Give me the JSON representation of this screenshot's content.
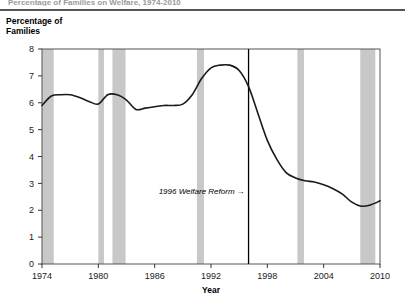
{
  "page": {
    "cut_off_header": "Percentage of Families on Welfare, 1974-2010",
    "y_axis_caption": "Percentage of\nFamilies"
  },
  "chart_data": {
    "type": "line",
    "title": "",
    "subtitle": "",
    "xlabel": "Year",
    "ylabel": "Percentage of Families",
    "xlim": [
      1974,
      2010
    ],
    "ylim": [
      0,
      8
    ],
    "xticks": [
      1974,
      1980,
      1986,
      1992,
      1998,
      2004,
      2010
    ],
    "xticklabels": [
      "1974",
      "1980",
      "1986",
      "1992",
      "1998",
      "2004",
      "2010"
    ],
    "yticks": [
      0,
      1,
      2,
      3,
      4,
      5,
      6,
      7,
      8
    ],
    "yticklabels": [
      "0",
      "1",
      "2",
      "3",
      "4",
      "5",
      "6",
      "7",
      "8"
    ],
    "grid": false,
    "legend": null,
    "line_color": "#1a1a1a",
    "band_color": "#c8c8c8",
    "marker_line_color": "#000000",
    "x": [
      1974,
      1975,
      1976,
      1977,
      1978,
      1979,
      1980,
      1981,
      1982,
      1983,
      1984,
      1985,
      1986,
      1987,
      1988,
      1989,
      1990,
      1991,
      1992,
      1993,
      1994,
      1995,
      1996,
      1997,
      1998,
      1999,
      2000,
      2001,
      2002,
      2003,
      2004,
      2005,
      2006,
      2007,
      2008,
      2009,
      2010
    ],
    "values": [
      5.9,
      6.25,
      6.3,
      6.3,
      6.2,
      6.05,
      5.95,
      6.3,
      6.3,
      6.1,
      5.75,
      5.8,
      5.85,
      5.9,
      5.9,
      5.95,
      6.3,
      6.9,
      7.3,
      7.4,
      7.4,
      7.2,
      6.6,
      5.6,
      4.6,
      3.9,
      3.4,
      3.2,
      3.1,
      3.05,
      2.95,
      2.8,
      2.6,
      2.3,
      2.15,
      2.2,
      2.35
    ],
    "recession_bands": [
      {
        "start": 1974.0,
        "end": 1975.25,
        "label": "1973-75 recession"
      },
      {
        "start": 1980.0,
        "end": 1980.6,
        "label": "1980 recession"
      },
      {
        "start": 1981.5,
        "end": 1982.9,
        "label": "1981-82 recession"
      },
      {
        "start": 1990.5,
        "end": 1991.25,
        "label": "1990-91 recession"
      },
      {
        "start": 2001.2,
        "end": 2001.9,
        "label": "2001 recession"
      },
      {
        "start": 2007.9,
        "end": 2009.5,
        "label": "2007-09 recession"
      }
    ],
    "annotations": [
      {
        "text": "1996 Welfare Reform",
        "arrow": "→",
        "marker_year": 1996,
        "text_y_value": 2.6
      }
    ]
  }
}
